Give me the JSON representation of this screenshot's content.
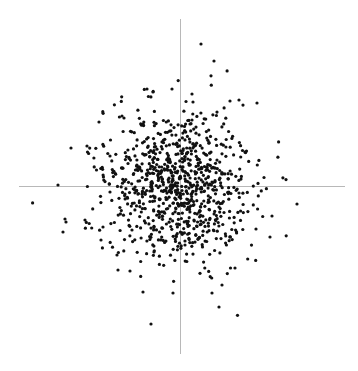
{
  "chart_data": {
    "type": "scatter",
    "title": "",
    "xlabel": "",
    "ylabel": "",
    "grid": false,
    "legend": null,
    "axes_style": "crosshair through origin, no ticks, no labels",
    "axis_color": "#b8b8b8",
    "point_color": "#111111",
    "point_radius_px": 1.6,
    "pixel_frame": {
      "x_axis": {
        "y": 186,
        "x_from": 19,
        "x_to": 345
      },
      "y_axis": {
        "x": 180,
        "y_from": 19,
        "y_to": 354
      }
    },
    "distribution": {
      "kind": "bivariate normal (approx.)",
      "center_px": [
        178,
        185
      ],
      "sigma_px": [
        36,
        38
      ],
      "n_points_approx": 900,
      "seed": 12345
    },
    "outliers_px": [
      [
        201,
        44
      ],
      [
        214,
        61
      ],
      [
        147,
        89
      ],
      [
        153,
        92
      ],
      [
        172,
        89
      ],
      [
        192,
        94
      ],
      [
        193,
        102
      ],
      [
        230,
        101
      ],
      [
        239,
        100
      ],
      [
        257,
        103
      ],
      [
        122,
        116
      ],
      [
        124,
        118
      ],
      [
        99,
        122
      ],
      [
        87,
        146
      ],
      [
        71,
        148
      ],
      [
        58,
        185
      ],
      [
        297,
        204
      ],
      [
        65,
        219
      ],
      [
        66,
        222
      ],
      [
        63,
        232
      ],
      [
        103,
        227
      ],
      [
        101,
        240
      ],
      [
        85,
        220
      ],
      [
        270,
        237
      ],
      [
        272,
        216
      ],
      [
        256,
        229
      ],
      [
        143,
        292
      ],
      [
        173,
        293
      ],
      [
        212,
        293
      ],
      [
        151,
        324
      ],
      [
        222,
        285
      ],
      [
        235,
        268
      ],
      [
        117,
        255
      ],
      [
        118,
        270
      ],
      [
        130,
        271
      ],
      [
        154,
        252
      ],
      [
        219,
        307
      ]
    ]
  }
}
